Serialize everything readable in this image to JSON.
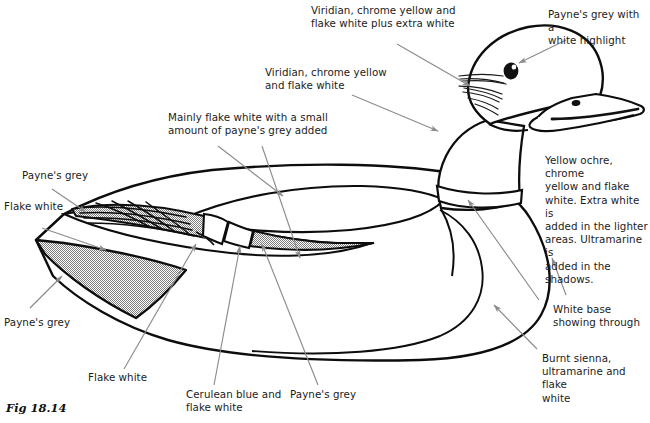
{
  "figure": {
    "caption": "Fig 18.14",
    "colors": {
      "outline": "#0d0d0d",
      "leader": "#8c8c8c",
      "text": "#1b1b1b",
      "stipple_fill": "#b9b9b9",
      "paper": "#ffffff",
      "eye": "#111111",
      "eye_highlight": "#ffffff"
    }
  },
  "annotations": [
    {
      "id": "viridian-extra-white",
      "text": "Viridian, chrome yellow and\nflake white plus extra white"
    },
    {
      "id": "paynes-grey-highlight",
      "text": "Payne's grey with a\nwhite highlight"
    },
    {
      "id": "viridian-chrome-flake",
      "text": "Viridian, chrome yellow\nand flake white"
    },
    {
      "id": "mainly-flake-white",
      "text": "Mainly flake white with a small\namount of payne's grey added"
    },
    {
      "id": "yellow-ochre-block",
      "text": "Yellow ochre, chrome\nyellow and flake\nwhite. Extra white is\nadded in the lighter\nareas. Ultramarine is\nadded in the\nshadows."
    },
    {
      "id": "paynes-grey-upper-left",
      "text": "Payne's grey"
    },
    {
      "id": "flake-white-upper-left",
      "text": "Flake white"
    },
    {
      "id": "paynes-grey-lower-left",
      "text": "Payne's grey"
    },
    {
      "id": "flake-white-bottom",
      "text": "Flake white"
    },
    {
      "id": "cerulean-blue",
      "text": "Cerulean blue and\nflake white"
    },
    {
      "id": "paynes-grey-bottom",
      "text": "Payne's grey"
    },
    {
      "id": "white-base",
      "text": "White base\nshowing through"
    },
    {
      "id": "burnt-sienna",
      "text": "Burnt sienna,\nultramarine and flake\nwhite"
    }
  ],
  "diagram_parts": [
    {
      "id": "head",
      "name": "duck-head"
    },
    {
      "id": "bill",
      "name": "duck-bill"
    },
    {
      "id": "eye",
      "name": "duck-eye"
    },
    {
      "id": "nostril",
      "name": "bill-nostril"
    },
    {
      "id": "cheek-feathers",
      "name": "cheek-feather-strokes"
    },
    {
      "id": "neck-ring",
      "name": "neck-collar-ring"
    },
    {
      "id": "body",
      "name": "duck-body"
    },
    {
      "id": "breast",
      "name": "duck-breast"
    },
    {
      "id": "wing",
      "name": "duck-wing"
    },
    {
      "id": "tail",
      "name": "duck-tail"
    },
    {
      "id": "tail-feathers",
      "name": "tail-feather-bands"
    }
  ]
}
